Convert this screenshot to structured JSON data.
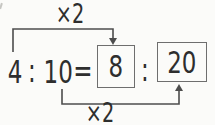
{
  "figure": {
    "terms": {
      "a": "4",
      "colon1": ":",
      "b": "10",
      "equals": "=",
      "c": "8",
      "colon2": ":",
      "d": "20"
    },
    "labels": {
      "top_multiplier": "×2",
      "bottom_multiplier": "×2"
    },
    "colors": {
      "background": "#fbfbf9",
      "text": "#2e2e2e",
      "line": "#4d4d4d",
      "box_border": "#6e6e6e"
    }
  }
}
